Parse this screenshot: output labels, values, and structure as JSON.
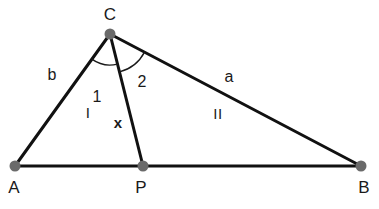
{
  "diagram": {
    "type": "triangle-with-cevian",
    "canvas": {
      "width": 379,
      "height": 209,
      "background": "#ffffff"
    },
    "style": {
      "line_color": "#111111",
      "line_width": 3,
      "vertex_color": "#6a6a6a",
      "vertex_radius": 5.5,
      "arc_color": "#1a1a1a",
      "arc_width": 1.4,
      "text_color": "#1a1a1a"
    },
    "points": {
      "A": {
        "label": "A",
        "x": 15,
        "y": 166,
        "label_x": 14,
        "label_y": 187
      },
      "B": {
        "label": "B",
        "x": 361,
        "y": 166,
        "label_x": 364,
        "label_y": 187
      },
      "C": {
        "label": "C",
        "x": 110,
        "y": 34,
        "label_x": 110,
        "label_y": 14
      },
      "P": {
        "label": "P",
        "x": 143,
        "y": 166,
        "label_x": 141,
        "label_y": 187
      }
    },
    "segments": [
      {
        "name": "side-b",
        "from": "A",
        "to": "C"
      },
      {
        "name": "side-a",
        "from": "C",
        "to": "B"
      },
      {
        "name": "base-AB",
        "from": "A",
        "to": "B"
      },
      {
        "name": "cevian-x",
        "from": "C",
        "to": "P"
      }
    ],
    "side_labels": [
      {
        "name": "side-label-b",
        "text": "b",
        "x": 52,
        "y": 75
      },
      {
        "name": "side-label-a",
        "text": "a",
        "x": 229,
        "y": 77
      },
      {
        "name": "segment-label-x",
        "text": "x",
        "x": 118,
        "y": 122
      }
    ],
    "angle_labels": [
      {
        "name": "angle-label-1",
        "text": "1",
        "x": 97,
        "y": 97
      },
      {
        "name": "angle-label-2",
        "text": "2",
        "x": 142,
        "y": 82
      }
    ],
    "region_labels": [
      {
        "name": "region-label-I",
        "text": "I",
        "x": 88,
        "y": 112
      },
      {
        "name": "region-label-II",
        "text": "II",
        "x": 218,
        "y": 113
      }
    ],
    "arcs": [
      {
        "name": "angle-arc-1",
        "vertex": "C",
        "radius": 31,
        "from_point": "A",
        "to_point": "P",
        "path": "M 81.0 63.6 A 31 31 0 0 1 117.6 64.2"
      },
      {
        "name": "angle-arc-2",
        "vertex": "C",
        "radius": 39,
        "from_point": "P",
        "to_point": "B",
        "path": "M 119.4 72.0 A 39 39 0 0 1 147.4 61.3"
      }
    ]
  }
}
